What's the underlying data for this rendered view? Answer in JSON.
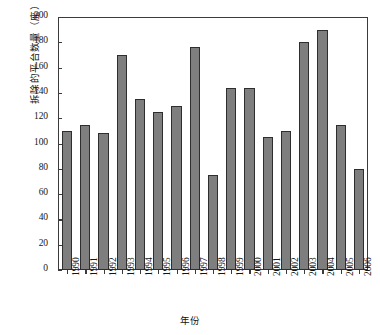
{
  "chart_data": {
    "type": "bar",
    "title": "",
    "xlabel": "年份",
    "ylabel": "拆除的平台数量（座）",
    "categories": [
      "1990",
      "1991",
      "1992",
      "1993",
      "1994",
      "1995",
      "1996",
      "1997",
      "1998",
      "1999",
      "2000",
      "2001",
      "2002",
      "2003",
      "2004",
      "2005",
      "2006"
    ],
    "values": [
      110,
      115,
      108,
      170,
      135,
      125,
      130,
      176,
      75,
      144,
      144,
      105,
      110,
      180,
      190,
      115,
      80
    ],
    "ylim": [
      0,
      200
    ],
    "yticks": [
      0,
      20,
      40,
      60,
      80,
      100,
      120,
      140,
      160,
      180,
      200
    ],
    "ytick_labels": [
      "0",
      "20",
      "40",
      "60",
      "80",
      "100",
      "120",
      "140",
      "160",
      "180",
      "200"
    ],
    "grid": false,
    "legend": null,
    "bar_color": "#7e7e7e",
    "bar_edge_color": "#2e2e2e",
    "axis_color": "#3b3b3b",
    "background": "#ffffff"
  }
}
